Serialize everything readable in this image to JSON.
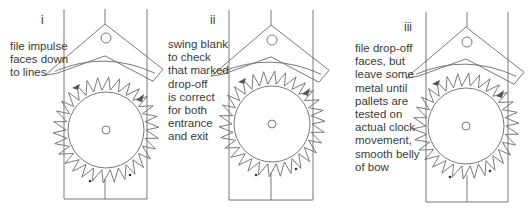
{
  "panels": [
    {
      "numeral": "i",
      "caption": "file impulse\nfaces down\nto lines",
      "numeral_pos": [
        41,
        17
      ],
      "caption_pos": [
        10,
        40
      ],
      "frame": {
        "left": 64,
        "right": 147,
        "top": 9,
        "bottom": 199,
        "center": 105
      },
      "diamond_apex": [
        105,
        24
      ],
      "hole": [
        106,
        38
      ],
      "wheel_center": [
        106,
        130
      ]
    },
    {
      "numeral": "ii",
      "caption": "swing blank\nto check\nthat marked\ndrop-off\nis correct\nfor both\nentrance\nand exit",
      "numeral_pos": [
        212,
        17
      ],
      "caption_pos": [
        168,
        40
      ],
      "frame": {
        "left": 229,
        "right": 313,
        "top": 10,
        "bottom": 200,
        "center": 271
      },
      "diamond_apex": [
        271,
        25
      ],
      "hole": [
        272,
        40
      ],
      "wheel_center": [
        272,
        124
      ]
    },
    {
      "numeral": "iii",
      "caption": "file drop-off\nfaces, but\nleave some\nmetal until\npallets are\ntested on\nactual clock\nmovement,\nsmooth belly\nof bow",
      "numeral_pos": [
        405,
        22
      ],
      "caption_pos": [
        355,
        42
      ],
      "frame": {
        "left": 426,
        "right": 508,
        "top": 12,
        "bottom": 202,
        "center": 467
      },
      "diamond_apex": [
        466,
        27
      ],
      "hole": [
        467,
        42
      ],
      "wheel_center": [
        466,
        126
      ]
    }
  ],
  "geometry": {
    "inner_radius": 38,
    "tooth_root": 40,
    "tooth_tip": 53,
    "teeth": 30,
    "diamond_half": 58
  },
  "colors": {
    "line": "#6a6a6a",
    "text": "#3a3a3a",
    "fill_dark": "#555555"
  }
}
